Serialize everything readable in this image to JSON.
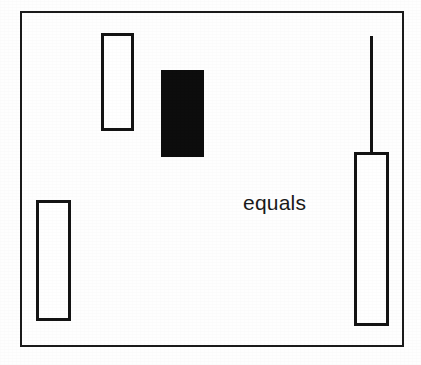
{
  "figure": {
    "kind": "schematic-bar-comparison",
    "background_color": "#fefefe",
    "stroke_color": "#141414",
    "fill_color": "#0d0d0d",
    "frame": {
      "name": "outer-frame",
      "x": 20,
      "y": 11,
      "width": 384,
      "height": 336,
      "stroke_width": 2
    },
    "label": {
      "text": "equals",
      "x": 243,
      "y": 192,
      "font_size": 21,
      "color": "#1a1a1a"
    },
    "shapes": [
      {
        "id": "bar-top-left",
        "style": "outline",
        "x": 101,
        "y": 33,
        "width": 33,
        "height": 98,
        "stroke_width": 3
      },
      {
        "id": "bar-center-filled",
        "style": "filled",
        "x": 161,
        "y": 70,
        "width": 43,
        "height": 87
      },
      {
        "id": "bar-bottom-left",
        "style": "outline",
        "x": 36,
        "y": 200,
        "width": 35,
        "height": 121,
        "stroke_width": 3
      },
      {
        "id": "bar-right",
        "style": "outline",
        "x": 354,
        "y": 152,
        "width": 35,
        "height": 174,
        "stroke_width": 3
      }
    ],
    "connector": {
      "id": "stem-line-right",
      "x": 370,
      "y": 36,
      "width": 3,
      "height": 117
    }
  }
}
